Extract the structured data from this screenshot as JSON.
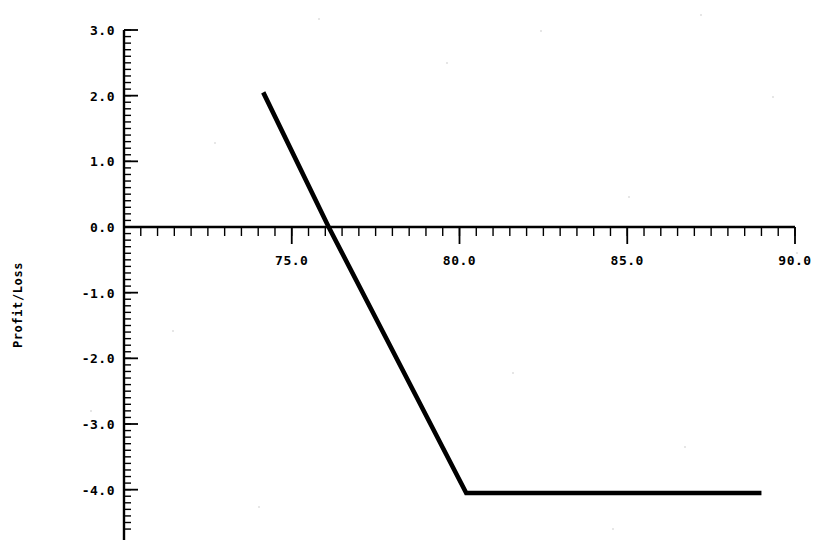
{
  "chart_data": {
    "type": "line",
    "title": "",
    "subtitle": "",
    "xlabel": "",
    "ylabel": "Profit/Loss",
    "xlim": [
      70.0,
      90.0
    ],
    "ylim": [
      -4.6,
      3.0
    ],
    "grid": false,
    "legend": null,
    "x_ticks": [
      70.0,
      75.0,
      80.0,
      85.0,
      90.0
    ],
    "x_tick_labels": [
      "",
      "75.0",
      "80.0",
      "85.0",
      "90.0"
    ],
    "x_minor_interval": 0.5,
    "y_ticks": [
      3.0,
      2.0,
      1.0,
      0.0,
      -1.0,
      -2.0,
      -3.0,
      -4.0
    ],
    "y_tick_labels": [
      "3.0",
      "2.0",
      "1.0",
      "0.0",
      "-1.0",
      "-2.0",
      "-3.0",
      "-4.0"
    ],
    "y_minor_interval": 0.1,
    "series": [
      {
        "name": "Profit/Loss",
        "color": "#000000",
        "x": [
          74.15,
          76.1,
          80.2,
          89.0
        ],
        "y": [
          2.05,
          0.0,
          -4.05,
          -4.05
        ]
      }
    ],
    "annotations": [],
    "breakeven_x": 76.1,
    "max_loss": -4.05
  },
  "axis": {
    "y_title": "Profit/Loss",
    "x_labels": [
      "75.0",
      "80.0",
      "85.0",
      "90.0"
    ],
    "y_labels": [
      "3.0",
      "2.0",
      "1.0",
      "0.0",
      "-1.0",
      "-2.0",
      "-3.0",
      "-4.0"
    ]
  },
  "colors": {
    "line": "#000000",
    "axis": "#000000",
    "background": "#ffffff"
  }
}
